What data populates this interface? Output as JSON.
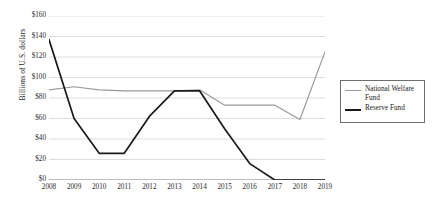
{
  "chart_data": {
    "type": "line",
    "title": "",
    "xlabel": "",
    "ylabel": "Billions of U.S. dollars",
    "categories": [
      "2008",
      "2009",
      "2010",
      "2011",
      "2012",
      "2013",
      "2014",
      "2015",
      "2016",
      "2017",
      "2018",
      "2019"
    ],
    "ylim": [
      0,
      160
    ],
    "ytick_labels": [
      "$0",
      "$20",
      "$40",
      "$60",
      "$80",
      "$100",
      "$120",
      "$140",
      "$160"
    ],
    "ytick_values": [
      0,
      20,
      40,
      60,
      80,
      100,
      120,
      140,
      160
    ],
    "grid": true,
    "legend_position": "right",
    "series": [
      {
        "name": "National Welfare Fund",
        "color": "#9a9a9a",
        "values": [
          88,
          91,
          88,
          87,
          87,
          87,
          88,
          73,
          73,
          73,
          59,
          125
        ]
      },
      {
        "name": "Reserve Fund",
        "color": "#1a1a1a",
        "values": [
          137,
          60,
          26,
          26,
          62,
          87,
          87,
          50,
          16,
          0,
          0,
          0
        ]
      }
    ]
  },
  "legend": {
    "items": [
      {
        "label": "National Welfare Fund",
        "swatch": "line-gray"
      },
      {
        "label": "Reserve Fund",
        "swatch": "line-black"
      }
    ]
  }
}
